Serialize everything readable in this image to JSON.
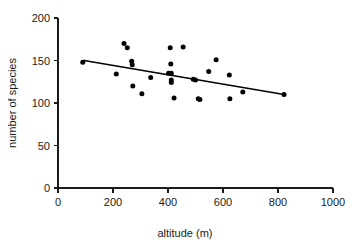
{
  "chart_data": {
    "type": "scatter",
    "title": "",
    "xlabel": "altitude (m)",
    "ylabel": "number of species",
    "xlim": [
      0,
      1000
    ],
    "ylim": [
      0,
      200
    ],
    "xticks": [
      0,
      200,
      400,
      600,
      800,
      1000
    ],
    "yticks": [
      0,
      50,
      100,
      150,
      200
    ],
    "grid": false,
    "legend": "none",
    "marker_color": "#000000",
    "line_color": "#000000",
    "points": [
      {
        "x": 90,
        "y": 148
      },
      {
        "x": 212,
        "y": 134
      },
      {
        "x": 240,
        "y": 170
      },
      {
        "x": 252,
        "y": 165
      },
      {
        "x": 268,
        "y": 149
      },
      {
        "x": 270,
        "y": 145
      },
      {
        "x": 272,
        "y": 120
      },
      {
        "x": 305,
        "y": 111
      },
      {
        "x": 337,
        "y": 130
      },
      {
        "x": 408,
        "y": 165
      },
      {
        "x": 410,
        "y": 146
      },
      {
        "x": 402,
        "y": 135
      },
      {
        "x": 412,
        "y": 135
      },
      {
        "x": 412,
        "y": 127
      },
      {
        "x": 412,
        "y": 124
      },
      {
        "x": 422,
        "y": 106
      },
      {
        "x": 455,
        "y": 166
      },
      {
        "x": 492,
        "y": 128
      },
      {
        "x": 500,
        "y": 127
      },
      {
        "x": 510,
        "y": 105
      },
      {
        "x": 516,
        "y": 104
      },
      {
        "x": 548,
        "y": 137
      },
      {
        "x": 575,
        "y": 151
      },
      {
        "x": 623,
        "y": 133
      },
      {
        "x": 625,
        "y": 105
      },
      {
        "x": 672,
        "y": 113
      },
      {
        "x": 822,
        "y": 110
      }
    ],
    "trend_line": {
      "x1": 95,
      "y1": 150,
      "x2": 822,
      "y2": 110
    }
  }
}
